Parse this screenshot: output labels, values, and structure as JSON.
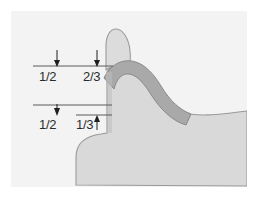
{
  "figure": {
    "background_color": "#f3f3f3",
    "page_color": "#ffffff",
    "frame": {
      "x": 11,
      "y": 11,
      "width": 236,
      "height": 176
    }
  },
  "colors": {
    "tissue_fill": "#d9d9d9",
    "tissue_outline": "#9a9a9a",
    "band_fill": "#a9a9a9",
    "band_outline": "#8a8a8a",
    "cusp_fill": "#dcdcdc",
    "cusp_outline": "#9b9b9b",
    "rule_line": "#5a5a5a",
    "arrow": "#1f1f1f",
    "label_text": "#2b2b2b"
  },
  "labels": [
    {
      "id": "upper-left-fraction",
      "text": "1/2",
      "x": 39,
      "y": 70
    },
    {
      "id": "upper-right-fraction",
      "text": "2/3",
      "x": 83,
      "y": 70
    },
    {
      "id": "lower-left-fraction",
      "text": "1/2",
      "x": 39,
      "y": 118
    },
    {
      "id": "lower-right-fraction",
      "text": "1/3",
      "x": 76,
      "y": 118
    }
  ],
  "rules": [
    {
      "id": "upper-rule",
      "x1": 33,
      "y": 66,
      "x2": 113
    },
    {
      "id": "middle-rule",
      "x1": 33,
      "y": 105,
      "x2": 112
    },
    {
      "id": "lower-rule",
      "x1": 76,
      "y": 115,
      "x2": 112
    }
  ],
  "arrows": [
    {
      "id": "arrow-upper-left",
      "x": 57,
      "y1": 50,
      "y2": 66
    },
    {
      "id": "arrow-upper-right",
      "x": 97,
      "y1": 50,
      "y2": 66
    },
    {
      "id": "arrow-lower-left",
      "x": 57,
      "y1": 105,
      "y2": 119
    },
    {
      "id": "arrow-lower-right",
      "x": 97,
      "y1": 130,
      "y2": 115
    }
  ],
  "shapes": {
    "tissue_mass": "M 76 185 L 76 157 C 76 142 86 136 101 134 L 107 133 L 107 70 C 110 66 115 63 121 62 C 133 60 144 68 152 82 C 160 96 170 108 181 112 C 195 117 215 115 246 111 L 246 185 Z",
    "band": "M 104 77 C 108 68 116 62 125 61 C 139 59 151 70 160 85 C 169 100 179 110 190 113 L 186 124 C 172 120 160 108 150 92 C 142 79 134 72 126 73 C 120 74 116 80 114 88 Z",
    "cusp": "M 107 69 L 107 45 C 107 35 111 29 117 29 C 124 29 129 38 130 50 C 131 58 130 64 128 68 C 122 64 114 65 107 69 Z"
  }
}
